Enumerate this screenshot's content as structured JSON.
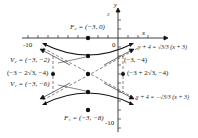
{
  "figure": {
    "type": "hyperbola",
    "center": {
      "text": "(-3, -4)",
      "x": -3,
      "y": -4
    },
    "axes": {
      "x_label": "x",
      "y_label": "y",
      "x_tick_label": "-10",
      "y_tick_label": "-10",
      "origin_label": "0",
      "y_top_tick": "2"
    },
    "foci": [
      {
        "name": "F2",
        "label": "F₂ = (−3, 0)",
        "x": -3,
        "y": 0
      },
      {
        "name": "F1",
        "label": "F₁ = (−3, −8)",
        "x": -3,
        "y": -8
      }
    ],
    "vertices": [
      {
        "name": "V2",
        "label": "V₂ = (−3, −2)",
        "x": -3,
        "y": -2
      },
      {
        "name": "V1",
        "label": "V₁ = (−3, −6)",
        "x": -3,
        "y": -6
      }
    ],
    "box_points": [
      {
        "label": "(−3 − 2√3, −4)",
        "x": -6.464,
        "y": -4
      },
      {
        "label": "(−3 + 2√3, −4)",
        "x": 0.464,
        "y": -4
      }
    ],
    "center_label": "(−3, −4)",
    "asymptotes": [
      {
        "label": "y + 4 = √3/3 (x + 3)",
        "slope": 0.577
      },
      {
        "label": "y + 4 = −√3/3 (x + 3)",
        "slope": -0.577
      }
    ],
    "colors": {
      "ink": "#111111",
      "dashed": "#333333"
    }
  }
}
